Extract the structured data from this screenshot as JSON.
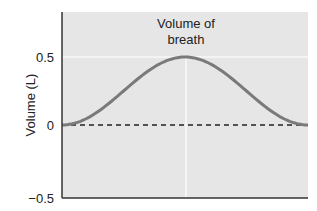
{
  "chart_data": {
    "type": "line",
    "title": "",
    "annotation": [
      "Volume of",
      "breath"
    ],
    "xlabel": "",
    "ylabel": "Volume (L)",
    "ylim": [
      -0.5,
      0.5
    ],
    "yticks": [
      0.5,
      0,
      -0.5
    ],
    "ytick_labels": [
      "0.5",
      "0",
      "−0.5"
    ],
    "grid": false,
    "reference_line": {
      "y": 0,
      "style": "dashed"
    },
    "series": [
      {
        "name": "Volume of breath",
        "x": [
          0,
          0.1,
          0.2,
          0.3,
          0.4,
          0.5,
          0.6,
          0.7,
          0.8,
          0.9,
          1.0
        ],
        "values": [
          0,
          0.05,
          0.17,
          0.33,
          0.45,
          0.5,
          0.45,
          0.33,
          0.17,
          0.05,
          0
        ]
      }
    ],
    "colors": {
      "curve": "#7a7a7a",
      "plot_bg": "#e6e6e6",
      "axis": "#333333",
      "dashed": "#222222",
      "guide": "#ffffff"
    }
  }
}
